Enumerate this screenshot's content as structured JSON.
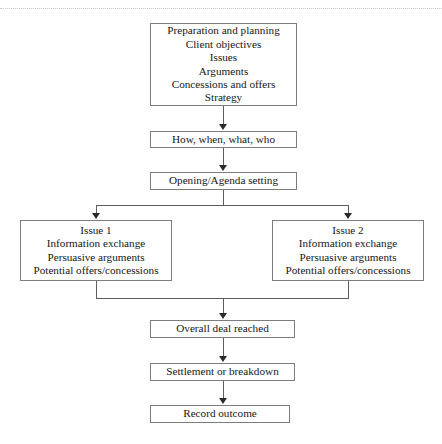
{
  "diagram": {
    "background_color": "#ffffff",
    "box_border_color": "#7d7d7d",
    "connector_color": "#5e5e5e",
    "text_color": "#161616",
    "nodes": {
      "preparation": {
        "lines": [
          "Preparation and planning",
          "Client objectives",
          "Issues",
          "Arguments",
          "Concessions and offers",
          "Strategy"
        ]
      },
      "how_when": {
        "lines": [
          "How, when, what, who"
        ]
      },
      "opening": {
        "lines": [
          "Opening/Agenda setting"
        ]
      },
      "issue1": {
        "lines": [
          "Issue 1",
          "Information exchange",
          "Persuasive arguments",
          "Potential offers/concessions"
        ]
      },
      "issue2": {
        "lines": [
          "Issue 2",
          "Information exchange",
          "Persuasive arguments",
          "Potential offers/concessions"
        ]
      },
      "overall_deal": {
        "lines": [
          "Overall deal reached"
        ]
      },
      "settlement": {
        "lines": [
          "Settlement or breakdown"
        ]
      },
      "record": {
        "lines": [
          "Record outcome"
        ]
      }
    }
  }
}
